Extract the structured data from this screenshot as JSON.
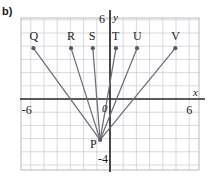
{
  "figure": {
    "part_label": "b)"
  },
  "chart_data": {
    "type": "scatter",
    "title": "",
    "xlabel": "x",
    "ylabel": "y",
    "xlim": [
      -7.5,
      7.5
    ],
    "ylim": [
      -5.5,
      7.0
    ],
    "grid": true,
    "legend": "none",
    "axis_ticks": {
      "x": [
        {
          "value": -6,
          "label": "-6"
        },
        {
          "value": 6,
          "label": "6"
        }
      ],
      "y": [
        {
          "value": 6,
          "label": "6"
        },
        {
          "value": -4,
          "label": "-4"
        }
      ],
      "origin_label": "0"
    },
    "points": [
      {
        "name": "P",
        "x": -0.75,
        "y": -3.1,
        "label_dx": -10,
        "label_dy": 7
      },
      {
        "name": "Q",
        "x": -5.8,
        "y": 3.85,
        "label_dx": -4,
        "label_dy": -9
      },
      {
        "name": "R",
        "x": -2.95,
        "y": 3.85,
        "label_dx": -4,
        "label_dy": -9
      },
      {
        "name": "S",
        "x": -1.3,
        "y": 3.85,
        "label_dx": -4,
        "label_dy": -9
      },
      {
        "name": "T",
        "x": 0.45,
        "y": 3.85,
        "label_dx": -4,
        "label_dy": -9
      },
      {
        "name": "U",
        "x": 2.05,
        "y": 3.85,
        "label_dx": -4,
        "label_dy": -9
      },
      {
        "name": "V",
        "x": 4.95,
        "y": 3.85,
        "label_dx": -4,
        "label_dy": -9
      }
    ],
    "segments": [
      {
        "from": "P",
        "to": "Q"
      },
      {
        "from": "P",
        "to": "R"
      },
      {
        "from": "P",
        "to": "S"
      },
      {
        "from": "P",
        "to": "T"
      },
      {
        "from": "P",
        "to": "U"
      },
      {
        "from": "P",
        "to": "V"
      }
    ],
    "colors": {
      "grid": "#c9c9d4",
      "axis": "#2b2b2b",
      "segment": "#6e6e78",
      "point": "#5a5a62",
      "text": "#1c1c1c",
      "border": "#b8b8c2"
    }
  }
}
